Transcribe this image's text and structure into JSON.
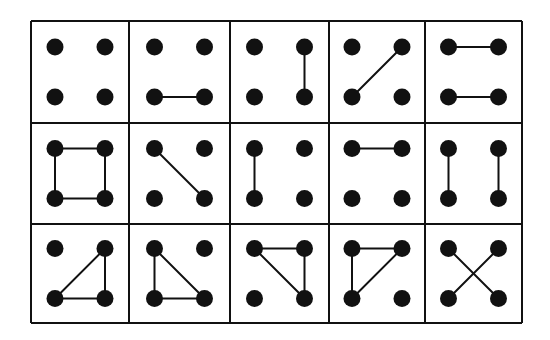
{
  "diagram": {
    "title": "",
    "rows": 3,
    "cols": 5,
    "colors": {
      "ink": "#111111",
      "background": "#ffffff"
    },
    "grid": {
      "x": [
        31,
        129,
        230,
        329,
        425,
        522
      ],
      "y": [
        21,
        123,
        224,
        323
      ]
    },
    "vertex_labels": [
      "TL",
      "TR",
      "BL",
      "BR"
    ],
    "cells": [
      {
        "row": 0,
        "col": 0,
        "edges": []
      },
      {
        "row": 0,
        "col": 1,
        "edges": [
          [
            "BL",
            "BR"
          ]
        ]
      },
      {
        "row": 0,
        "col": 2,
        "edges": [
          [
            "TR",
            "BR"
          ]
        ]
      },
      {
        "row": 0,
        "col": 3,
        "edges": [
          [
            "BL",
            "TR"
          ]
        ]
      },
      {
        "row": 0,
        "col": 4,
        "edges": [
          [
            "TL",
            "TR"
          ],
          [
            "BL",
            "BR"
          ]
        ]
      },
      {
        "row": 1,
        "col": 0,
        "edges": [
          [
            "TL",
            "TR"
          ],
          [
            "TR",
            "BR"
          ],
          [
            "BR",
            "BL"
          ],
          [
            "BL",
            "TL"
          ]
        ]
      },
      {
        "row": 1,
        "col": 1,
        "edges": [
          [
            "TL",
            "BR"
          ]
        ]
      },
      {
        "row": 1,
        "col": 2,
        "edges": [
          [
            "TL",
            "BL"
          ]
        ]
      },
      {
        "row": 1,
        "col": 3,
        "edges": [
          [
            "TL",
            "TR"
          ]
        ]
      },
      {
        "row": 1,
        "col": 4,
        "edges": [
          [
            "TL",
            "BL"
          ],
          [
            "TR",
            "BR"
          ]
        ]
      },
      {
        "row": 2,
        "col": 0,
        "edges": [
          [
            "TR",
            "BL"
          ],
          [
            "BL",
            "BR"
          ],
          [
            "TR",
            "BR"
          ]
        ]
      },
      {
        "row": 2,
        "col": 1,
        "edges": [
          [
            "TL",
            "BL"
          ],
          [
            "BL",
            "BR"
          ],
          [
            "TL",
            "BR"
          ]
        ]
      },
      {
        "row": 2,
        "col": 2,
        "edges": [
          [
            "TL",
            "TR"
          ],
          [
            "TR",
            "BR"
          ],
          [
            "TL",
            "BR"
          ]
        ]
      },
      {
        "row": 2,
        "col": 3,
        "edges": [
          [
            "TL",
            "TR"
          ],
          [
            "TL",
            "BL"
          ],
          [
            "TR",
            "BL"
          ]
        ]
      },
      {
        "row": 2,
        "col": 4,
        "edges": [
          [
            "TL",
            "BR"
          ],
          [
            "TR",
            "BL"
          ]
        ]
      }
    ]
  }
}
